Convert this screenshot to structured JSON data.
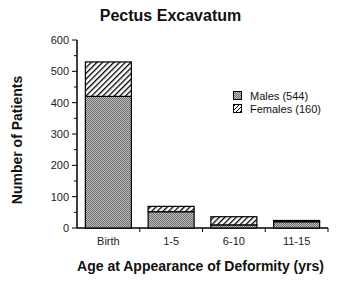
{
  "chart_data": {
    "type": "bar",
    "stacked": true,
    "title": "Pectus Excavatum",
    "xlabel": "Age at Appearance of Deformity (yrs)",
    "ylabel": "Number of Patients",
    "ylim": [
      0,
      600
    ],
    "yticks": [
      0,
      100,
      200,
      300,
      400,
      500,
      600
    ],
    "categories": [
      "Birth",
      "1-5",
      "6-10",
      "11-15"
    ],
    "series": [
      {
        "name": "Males (544)",
        "values": [
          420,
          52,
          10,
          20
        ],
        "pattern": "stipple"
      },
      {
        "name": "Females (160)",
        "values": [
          110,
          17,
          26,
          4
        ],
        "pattern": "hatch"
      }
    ],
    "legend_position": "right-inside",
    "grid": false
  },
  "title": "Pectus Excavatum",
  "xlabel": "Age at Appearance of Deformity (yrs)",
  "ylabel": "Number of Patients",
  "legend": {
    "males": "Males (544)",
    "females": "Females (160)"
  }
}
